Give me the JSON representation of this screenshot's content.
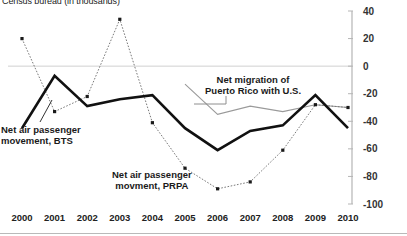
{
  "chart_data": {
    "type": "line",
    "title": "Census bureau (in thousands)",
    "xlabel": "",
    "ylabel": "",
    "ylim": [
      -100,
      40
    ],
    "ytick_step": 20,
    "grid": false,
    "zero_line": true,
    "legend_position": "inline-annotations",
    "categories": [
      "2000",
      "2001",
      "2002",
      "2003",
      "2004",
      "2005",
      "2006",
      "2007",
      "2008",
      "2009",
      "2010"
    ],
    "yticks": [
      "40",
      "20",
      "0",
      "-20",
      "-40",
      "-60",
      "-80",
      "-100"
    ],
    "series": [
      {
        "name": "Net air passenger movement, BTS",
        "style": "solid-thick-black",
        "color": "#111111",
        "values": [
          -45,
          -7,
          -29,
          -24,
          -21,
          -45,
          -61,
          -47,
          -43,
          -21,
          -45
        ]
      },
      {
        "name": "Net air passenger movment, PRPA",
        "style": "dotted-gray-markers",
        "color": "#7a7a7a",
        "values": [
          20,
          -33,
          -22,
          34,
          -41,
          -74,
          -89,
          -84,
          -61,
          -28,
          -30
        ]
      },
      {
        "name": "Net migration of Puerto Rico with U.S.",
        "style": "thin-gray",
        "color": "#9a9a9a",
        "values": [
          null,
          null,
          null,
          null,
          null,
          -13,
          -35,
          -29,
          -33,
          -28,
          -30
        ]
      }
    ],
    "annotations": [
      {
        "id": "bts",
        "text_line1": "Net air passenger",
        "text_line2": "movement, BTS"
      },
      {
        "id": "prpa",
        "text_line1": "Net air passenger",
        "text_line2": "movment, PRPA"
      },
      {
        "id": "migration",
        "text_line1": "Net migration of",
        "text_line2": "Puerto Rico with U.S."
      }
    ]
  }
}
